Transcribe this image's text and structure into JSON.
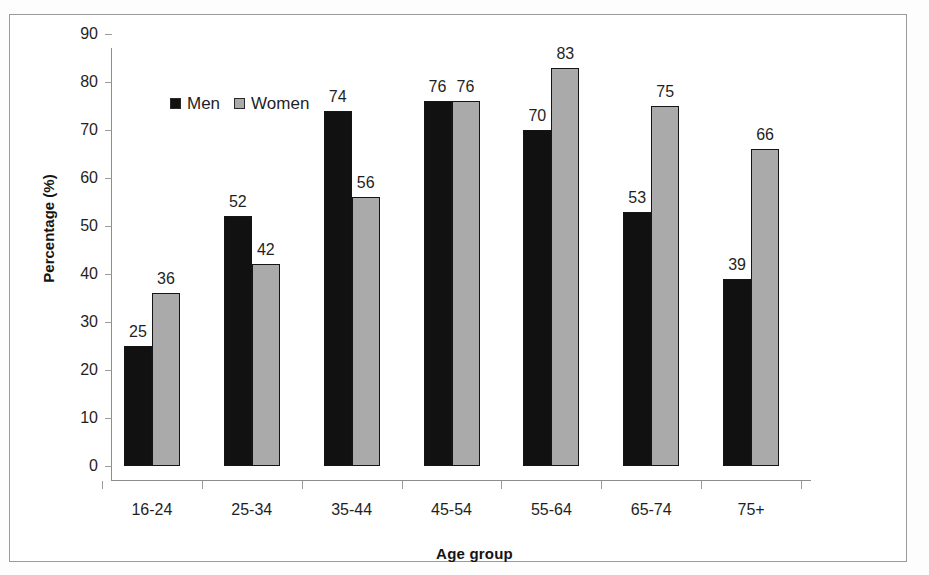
{
  "chart_data": {
    "type": "bar",
    "title": "",
    "xlabel": "Age group",
    "ylabel": "Percentage (%)",
    "categories": [
      "16-24",
      "25-34",
      "35-44",
      "45-54",
      "55-64",
      "65-74",
      "75+"
    ],
    "series": [
      {
        "name": "Men",
        "color": "#111111",
        "values": [
          25,
          52,
          74,
          76,
          70,
          53,
          39
        ]
      },
      {
        "name": "Women",
        "color": "#aaaaaa",
        "values": [
          36,
          42,
          56,
          76,
          83,
          75,
          66
        ]
      }
    ],
    "ylim": [
      0,
      90
    ],
    "ytick_step": 10,
    "yticks": [
      0,
      10,
      20,
      30,
      40,
      50,
      60,
      70,
      80,
      90
    ],
    "grid": false,
    "legend_position": "inside-top-left",
    "data_labels": true
  },
  "legend": {
    "men_label": "Men",
    "women_label": "Women"
  },
  "axes": {
    "x_title": "Age group",
    "y_title": "Percentage (%)"
  }
}
